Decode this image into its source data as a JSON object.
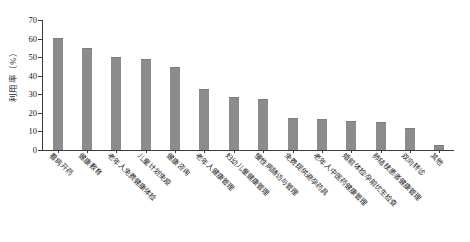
{
  "chart_data": {
    "type": "bar",
    "title": "",
    "xlabel": "",
    "ylabel": "利用率（%）",
    "ylim": [
      0,
      70
    ],
    "yticks": [
      0,
      10,
      20,
      30,
      40,
      50,
      60,
      70
    ],
    "grid": false,
    "legend": "none",
    "bar_color": "#8c8c8c",
    "axis_color": "#3a3a3a",
    "categories": [
      "看病开药",
      "健康教育",
      "老年人免费健康体检",
      "儿童计划免疫",
      "健康咨询",
      "老年人健康管理",
      "妇幼儿童健康管理",
      "慢性病随访与管理",
      "免费提供避孕药具",
      "老年人中医药健康管理",
      "婚前体检/孕前优生检查",
      "肺结核患者健康管理",
      "双向转诊",
      "其他"
    ],
    "values": [
      60.5,
      55.2,
      50.0,
      48.8,
      44.5,
      33.0,
      28.5,
      27.5,
      17.0,
      16.8,
      15.5,
      15.0,
      12.0,
      2.8
    ]
  }
}
